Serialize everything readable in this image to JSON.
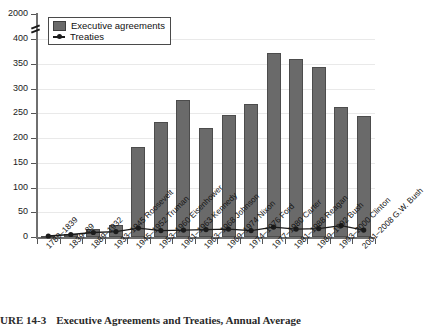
{
  "figure": {
    "caption_number": "URE 14-3",
    "caption_text": "Executive Agreements and Treaties, Annual Average"
  },
  "legend": {
    "position": "top-left",
    "items": [
      {
        "label": "Executive agreements",
        "marker": "bar-swatch-icon",
        "color": "#6a6a6a"
      },
      {
        "label": "Treaties",
        "marker": "line-marker-icon",
        "color": "#1b1b1b"
      }
    ]
  },
  "axes": {
    "y_ticks": [
      "0",
      "50",
      "100",
      "150",
      "200",
      "250",
      "300",
      "350",
      "400",
      "2000"
    ],
    "y_break_between": [
      "400",
      "2000"
    ],
    "x_label": "",
    "y_label": ""
  },
  "chart_data": {
    "type": "bar",
    "title": "Executive Agreements and Treaties, Annual Average",
    "xlabel": "",
    "ylabel": "",
    "ylim": [
      0,
      400
    ],
    "grid": true,
    "legend_position": "top-left",
    "axis_break": {
      "from": 400,
      "to": 2000
    },
    "categories": [
      "1789–1839",
      "1839–89",
      "1889–1932",
      "1933–1945 Roosevelt",
      "1945–1952 Truman",
      "1953–1960 Eisenhower",
      "1961–1963 Kennedy",
      "1963–1968 Johnson",
      "1969–1974 Nixon",
      "1974–1976 Ford",
      "1977–1980 Carter",
      "1981–1988 Reagan",
      "1989–1992 Bush",
      "1993–2000 Clinton",
      "2001–2008 G.W. Bush"
    ],
    "series": [
      {
        "name": "Executive agreements",
        "type": "bar",
        "color": "#6a6a6a",
        "values": [
          2,
          7,
          17,
          25,
          181,
          233,
          276,
          220,
          247,
          268,
          371,
          360,
          343,
          262,
          245
        ]
      },
      {
        "name": "Treaties",
        "type": "line",
        "color": "#1b1b1b",
        "values": [
          2,
          5,
          9,
          11,
          18,
          13,
          14,
          15,
          16,
          13,
          20,
          16,
          17,
          23,
          14
        ]
      }
    ]
  }
}
